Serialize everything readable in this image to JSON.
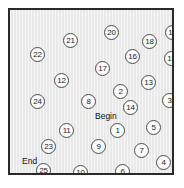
{
  "figure": {
    "type": "node-scatter-diagram",
    "background_color": "#ffffff",
    "plot_background_color": "#e9e9e9",
    "border_color": "#2a2a2a",
    "node_fill_color": "#fbfbfb",
    "node_border_color": "#4a4a4a",
    "text_color": "#111111"
  },
  "annotations": [
    {
      "id": "begin",
      "label": "Begin",
      "x": 85,
      "y": 102
    },
    {
      "id": "end",
      "label": "End",
      "x": 12,
      "y": 147
    }
  ],
  "nodes": [
    {
      "label": "1",
      "x": 100,
      "y": 113
    },
    {
      "label": "2",
      "x": 103,
      "y": 74
    },
    {
      "label": "3",
      "x": 152,
      "y": 83
    },
    {
      "label": "4",
      "x": 146,
      "y": 145
    },
    {
      "label": "5",
      "x": 136,
      "y": 110
    },
    {
      "label": "6",
      "x": 105,
      "y": 154
    },
    {
      "label": "7",
      "x": 124,
      "y": 133
    },
    {
      "label": "8",
      "x": 71,
      "y": 84
    },
    {
      "label": "9",
      "x": 81,
      "y": 129
    },
    {
      "label": "10",
      "x": 63,
      "y": 155
    },
    {
      "label": "11",
      "x": 49,
      "y": 113
    },
    {
      "label": "12",
      "x": 44,
      "y": 63
    },
    {
      "label": "13",
      "x": 131,
      "y": 65
    },
    {
      "label": "14",
      "x": 113,
      "y": 90
    },
    {
      "label": "15",
      "x": 154,
      "y": 41
    },
    {
      "label": "16",
      "x": 115,
      "y": 39
    },
    {
      "label": "17",
      "x": 85,
      "y": 51
    },
    {
      "label": "18",
      "x": 132,
      "y": 24
    },
    {
      "label": "19",
      "x": 155,
      "y": 15
    },
    {
      "label": "20",
      "x": 94,
      "y": 15
    },
    {
      "label": "21",
      "x": 53,
      "y": 23
    },
    {
      "label": "22",
      "x": 20,
      "y": 37
    },
    {
      "label": "23",
      "x": 31,
      "y": 129
    },
    {
      "label": "24",
      "x": 20,
      "y": 84
    },
    {
      "label": "25",
      "x": 26,
      "y": 153
    }
  ]
}
